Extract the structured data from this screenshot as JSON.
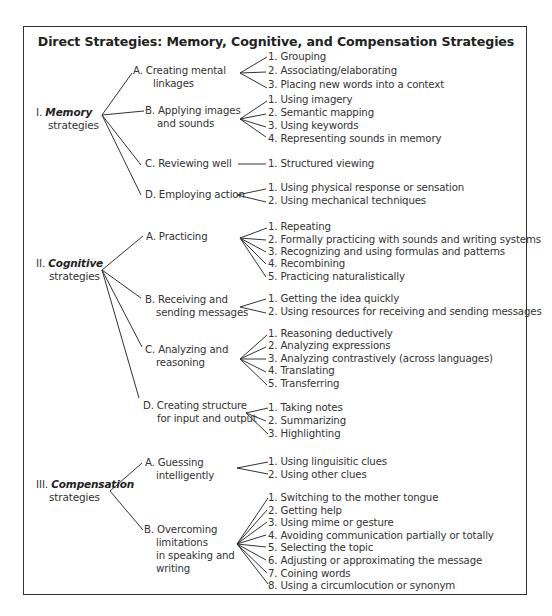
{
  "title": "Direct Strategies: Memory, Cognitive, and Compensation Strategies",
  "categories": [
    {
      "numeral": "I.",
      "name": "Memory",
      "suffix": "strategies",
      "groups": [
        {
          "label_1": "A. Creating mental",
          "label_2": "linkages",
          "items": [
            "1. Grouping",
            "2. Associating/elaborating",
            "3. Placing new words into a context"
          ]
        },
        {
          "label_1": "B. Applying images",
          "label_2": "and sounds",
          "items": [
            "1. Using imagery",
            "2. Semantic mapping",
            "3. Using keywords",
            "4. Representing sounds in memory"
          ]
        },
        {
          "label_1": "C. Reviewing well",
          "items": [
            "1. Structured viewing"
          ]
        },
        {
          "label_1": "D. Employing action",
          "items": [
            "1. Using physical response or sensation",
            "2. Using mechanical techniques"
          ]
        }
      ]
    },
    {
      "numeral": "II.",
      "name": "Cognitive",
      "suffix": "strategies",
      "groups": [
        {
          "label_1": "A. Practicing",
          "items": [
            "1. Repeating",
            "2. Formally practicing with sounds and writing systems",
            "3. Recognizing and using formulas and patterns",
            "4. Recombining",
            "5. Practicing naturalistically"
          ]
        },
        {
          "label_1": "B. Receiving and",
          "label_2": "sending messages",
          "items": [
            "1. Getting the idea quickly",
            "2. Using resources for receiving and sending messages"
          ]
        },
        {
          "label_1": "C. Analyzing and",
          "label_2": "reasoning",
          "items": [
            "1. Reasoning deductively",
            "2. Analyzing expressions",
            "3. Analyzing contrastively (across languages)",
            "4. Translating",
            "5. Transferring"
          ]
        },
        {
          "label_1": "D. Creating structure",
          "label_2": "for input and output",
          "items": [
            "1. Taking notes",
            "2. Summarizing",
            "3. Highlighting"
          ]
        }
      ]
    },
    {
      "numeral": "III.",
      "name": "Compensation",
      "suffix": "strategies",
      "groups": [
        {
          "label_1": "A. Guessing",
          "label_2": "intelligently",
          "items": [
            "1. Using linguisitic clues",
            "2. Using other clues"
          ]
        },
        {
          "label_1": "B. Overcoming",
          "label_2": "limitations",
          "label_3": "in speaking and",
          "label_4": "writing",
          "items": [
            "1. Switching to the mother tongue",
            "2. Getting help",
            "3. Using mime or gesture",
            "4. Avoiding communication partially or totally",
            "5. Selecting the topic",
            "6. Adjusting or approximating the message",
            "7. Coining words",
            "8. Using a circumlocution or synonym"
          ]
        }
      ]
    }
  ]
}
